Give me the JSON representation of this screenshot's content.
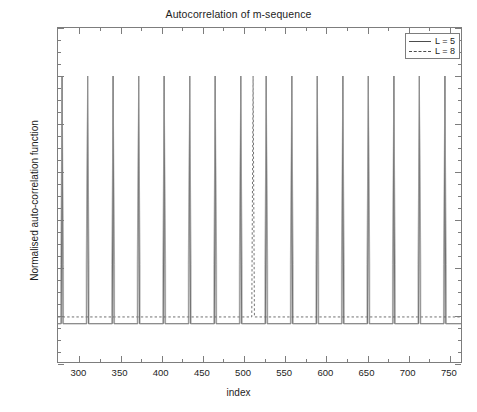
{
  "chart_data": {
    "type": "line",
    "title": "Autocorrelation of m-sequence",
    "xlabel": "index",
    "ylabel": "Normalised auto-correlation function",
    "xlim": [
      274,
      766
    ],
    "ylim": [
      -0.2,
      1.2
    ],
    "xticks": [
      300,
      350,
      400,
      450,
      500,
      550,
      600,
      650,
      700,
      750
    ],
    "xtick_labels": [
      "300",
      "350",
      "400",
      "450",
      "500",
      "550",
      "600",
      "650",
      "700",
      "750"
    ],
    "yticks": [
      -0.2,
      0,
      0.2,
      0.4,
      0.6,
      0.8,
      1,
      1.2
    ],
    "ytick_labels": [
      "-0.2",
      "0",
      "0.2",
      "0.4",
      "0.6",
      "0.8",
      "1",
      "1.2"
    ],
    "grid": false,
    "legend_position": "upper-right",
    "legend": [
      {
        "label": "L = 5",
        "style": "solid",
        "color": "#4d4d4d"
      },
      {
        "label": "L = 8",
        "style": "dashed",
        "color": "#4d4d4d"
      }
    ],
    "series": [
      {
        "name": "L = 5",
        "style": "solid",
        "color": "#4d4d4d",
        "period": 31,
        "peak_value": 1,
        "baseline_value": -0.0323,
        "shoulder_value": 0.215,
        "peak_indices": [
          279,
          310,
          341,
          372,
          403,
          434,
          465,
          496,
          527,
          558,
          589,
          620,
          651,
          682,
          713,
          744
        ]
      },
      {
        "name": "L = 8",
        "style": "dashed",
        "color": "#4d4d4d",
        "period": 255,
        "peak_value": 1,
        "baseline_value": -0.0039,
        "peak_indices": [
          511,
          766
        ]
      }
    ]
  },
  "axis_titles": {
    "x": "index",
    "y": "Normalised auto-correlation function"
  },
  "title": "Autocorrelation of m-sequence"
}
